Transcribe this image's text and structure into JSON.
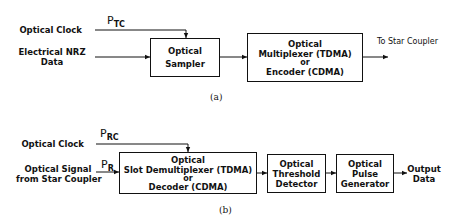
{
  "diagram_a": {
    "caption": "(a)",
    "inputs": {
      "clock_label": "Optical Clock",
      "data_label_line1": "Electrical NRZ",
      "data_label_line2": "Data",
      "clock_signal": "P",
      "clock_signal_sub": "TC"
    },
    "blocks": [
      {
        "lines": [
          "Optical",
          "Sampler"
        ]
      },
      {
        "lines": [
          "Optical",
          "Multiplexer (TDMA)",
          "or",
          "Encoder (CDMA)"
        ]
      }
    ],
    "output_label": "To Star Coupler"
  },
  "diagram_b": {
    "caption": "(b)",
    "inputs": {
      "clock_label": "Optical Clock",
      "signal_label_line1": "Optical Signal",
      "signal_label_line2": "from Star Coupler",
      "clock_signal": "P",
      "clock_signal_sub": "RC",
      "rx_signal": "P",
      "rx_signal_sub": "R"
    },
    "blocks": [
      {
        "lines": [
          "Optical",
          "Slot Demultiplexer (TDMA)",
          "or",
          "Decoder (CDMA)"
        ]
      },
      {
        "lines": [
          "Optical",
          "Threshold",
          "Detector"
        ]
      },
      {
        "lines": [
          "Optical",
          "Pulse",
          "Generator"
        ]
      }
    ],
    "output_label_line1": "Output",
    "output_label_line2": "Data"
  }
}
